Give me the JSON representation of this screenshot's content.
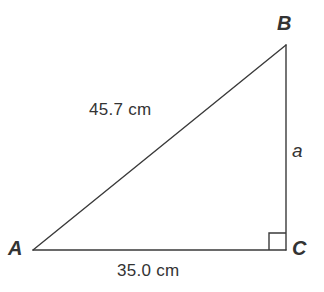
{
  "figure": {
    "type": "right-triangle",
    "background_color": "#ffffff",
    "stroke_color": "#3a3a3a",
    "text_color": "#333333",
    "stroke_width": 1.4
  },
  "vertices": {
    "a": {
      "label": "A",
      "x": 33,
      "y": 250
    },
    "b": {
      "label": "B",
      "x": 286,
      "y": 45
    },
    "c": {
      "label": "C",
      "x": 286,
      "y": 250
    }
  },
  "right_angle": {
    "at_vertex": "C",
    "marker_size": 17,
    "marker_label": "right-angle-marker"
  },
  "sides": {
    "hypotenuse": {
      "name": "AB",
      "label": "45.7 cm",
      "value": 45.7,
      "unit": "cm"
    },
    "base": {
      "name": "AC",
      "label": "35.0 cm",
      "value": 35.0,
      "unit": "cm"
    },
    "vertical": {
      "name": "BC",
      "label": "a",
      "value": null,
      "unit": "cm"
    }
  }
}
